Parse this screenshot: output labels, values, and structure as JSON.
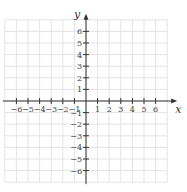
{
  "chart_data": {
    "type": "scatter",
    "title": "",
    "xlabel": "x",
    "ylabel": "y",
    "xlim": [
      -7,
      7
    ],
    "ylim": [
      -7,
      7
    ],
    "grid": true,
    "x_ticks": [
      -6,
      -5,
      -4,
      -3,
      -2,
      -1,
      1,
      2,
      3,
      4,
      5,
      6
    ],
    "y_ticks": [
      6,
      5,
      4,
      3,
      2,
      1,
      -1,
      -2,
      -3,
      -4,
      -5,
      -6
    ],
    "x_tick_labels": [
      "−6",
      "−5",
      "−4",
      "−3",
      "−2",
      "−1",
      "1",
      "2",
      "3",
      "4",
      "5",
      "6"
    ],
    "y_tick_labels": [
      "6",
      "5",
      "4",
      "3",
      "2",
      "1",
      "−1",
      "−2",
      "−3",
      "−4",
      "−5",
      "−6"
    ],
    "series": [],
    "legend": null
  },
  "colors": {
    "grid": "#e4e4e4",
    "axis": "#333333",
    "background": "#ffffff"
  },
  "layout": {
    "origin_x": 86,
    "origin_y": 101,
    "unit": 11.6,
    "grid_min": -7,
    "grid_max": 7
  }
}
